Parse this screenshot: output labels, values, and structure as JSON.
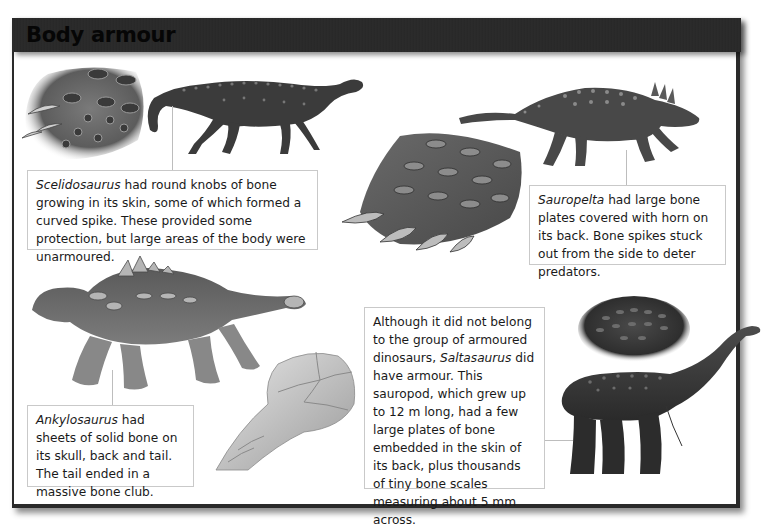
{
  "page": {
    "title": "Body armour",
    "colors": {
      "header_bg": "#282828",
      "title_text": "#060606",
      "caption_border": "#c9c9c9",
      "connector": "#bdbdbd",
      "body_text": "#1a1a1a"
    }
  },
  "captions": {
    "scelidosaurus": {
      "species": "Scelidosaurus",
      "text": " had round knobs of bone growing in its skin, some of which formed a curved spike. These provided some protection, but large areas of the body were unarmoured."
    },
    "sauropelta": {
      "species": "Sauropelta",
      "text": " had large bone plates covered with horn on its back. Bone spikes stuck out from the side to deter predators."
    },
    "ankylosaurus": {
      "species": "Ankylosaurus",
      "text": " had sheets of solid bone on its skull, back and tail. The tail ended in a massive bone club."
    },
    "saltasaurus": {
      "text_before": "Although it did not belong to the group of armoured dinosaurs, ",
      "species": "Saltasaurus",
      "text_after": " did have armour. This sauropod, which grew up to 12 m long, had a few large plates of bone embedded in the skin of its back, plus thousands of tiny bone scales measuring about 5 mm across."
    }
  },
  "illustrations": [
    {
      "id": "scelidosaurus-skin",
      "depicts": "skin patch with bony knobs and curved spikes"
    },
    {
      "id": "scelidosaurus",
      "depicts": "Scelidosaurus full body"
    },
    {
      "id": "sauropelta-skin",
      "depicts": "armour plate patch with side spikes"
    },
    {
      "id": "sauropelta",
      "depicts": "Sauropelta full body"
    },
    {
      "id": "ankylosaurus",
      "depicts": "Ankylosaurus full body"
    },
    {
      "id": "ankylosaurus-tail-club",
      "depicts": "bone tail club close-up"
    },
    {
      "id": "saltasaurus-skin",
      "depicts": "skin patch with bone scales"
    },
    {
      "id": "saltasaurus",
      "depicts": "Saltasaurus full body"
    }
  ]
}
